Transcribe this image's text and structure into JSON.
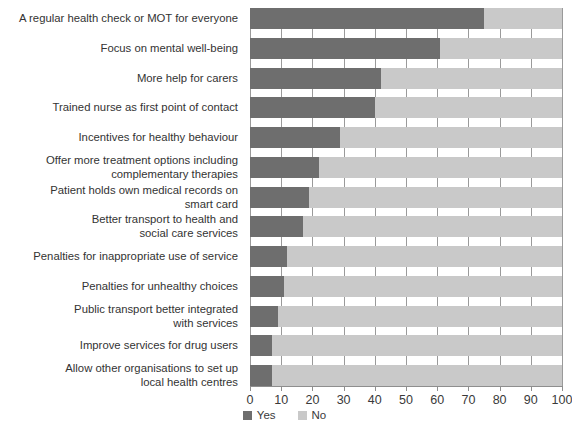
{
  "chart_data": {
    "type": "bar",
    "orientation": "horizontal",
    "stacked": true,
    "stack_total": 100,
    "title": "",
    "subtitle": "",
    "xlabel": "",
    "ylabel": "",
    "xlim": [
      0,
      100
    ],
    "xticks": [
      0,
      10,
      20,
      30,
      40,
      50,
      60,
      70,
      80,
      90,
      100
    ],
    "xticklabels": [
      "0",
      "10",
      "20",
      "30",
      "40",
      "50",
      "60",
      "70",
      "80",
      "90",
      "100"
    ],
    "grid": true,
    "grid_axis": "x",
    "legend_position": "bottom-center",
    "categories": [
      "A regular health check or MOT for everyone",
      "Focus on mental well-being",
      "More help for carers",
      "Trained nurse as first point of contact",
      "Incentives for healthy behaviour",
      "Offer more treatment options including\ncomplementary therapies",
      "Patient holds own medical records on\nsmart card",
      "Better transport to health and\nsocial care services",
      "Penalties for inappropriate use of service",
      "Penalties for unhealthy choices",
      "Public transport better integrated\nwith services",
      "Improve services for drug users",
      "Allow other organisations to set up\nlocal health centres"
    ],
    "series": [
      {
        "name": "Yes",
        "color": "#6e6e6e",
        "values": [
          75,
          61,
          42,
          40,
          29,
          22,
          19,
          17,
          12,
          11,
          9,
          7,
          7
        ]
      },
      {
        "name": "No",
        "color": "#c9c9c9",
        "values": [
          25,
          39,
          58,
          60,
          71,
          78,
          81,
          83,
          88,
          89,
          91,
          93,
          93
        ]
      }
    ]
  },
  "legend": {
    "items": [
      {
        "label": "Yes",
        "color": "#6e6e6e"
      },
      {
        "label": "No",
        "color": "#c9c9c9"
      }
    ]
  }
}
